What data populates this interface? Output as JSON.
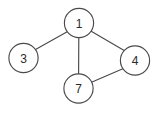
{
  "diagram": {
    "type": "undirected-graph",
    "title": "",
    "background_color": "#ffffff",
    "stroke_color": "#4a4a4a",
    "label_color": "#2b2b2b",
    "canvas": {
      "width": 158,
      "height": 115
    },
    "nodes": [
      {
        "id": "1",
        "label": "1",
        "cx": 79,
        "cy": 23,
        "r": 14.6
      },
      {
        "id": "3",
        "label": "3",
        "cx": 23.5,
        "cy": 58,
        "r": 14.6
      },
      {
        "id": "4",
        "label": "4",
        "cx": 135,
        "cy": 60.5,
        "r": 14.6
      },
      {
        "id": "7",
        "label": "7",
        "cx": 78.5,
        "cy": 88.5,
        "r": 14.6
      }
    ],
    "edges": [
      {
        "id": "edge-3-1",
        "source": "3",
        "target": "1",
        "x1": 35.5,
        "y1": 49.6,
        "x2": 67.2,
        "y2": 31.8
      },
      {
        "id": "edge-1-4",
        "source": "1",
        "target": "4",
        "x1": 91.2,
        "y1": 31.2,
        "x2": 124.6,
        "y2": 50.8
      },
      {
        "id": "edge-1-7",
        "source": "1",
        "target": "7",
        "x1": 78.8,
        "y1": 37.6,
        "x2": 78.6,
        "y2": 73.9
      },
      {
        "id": "edge-7-4",
        "source": "7",
        "target": "4",
        "x1": 91.5,
        "y1": 82.2,
        "x2": 124.0,
        "y2": 68.3
      }
    ]
  }
}
